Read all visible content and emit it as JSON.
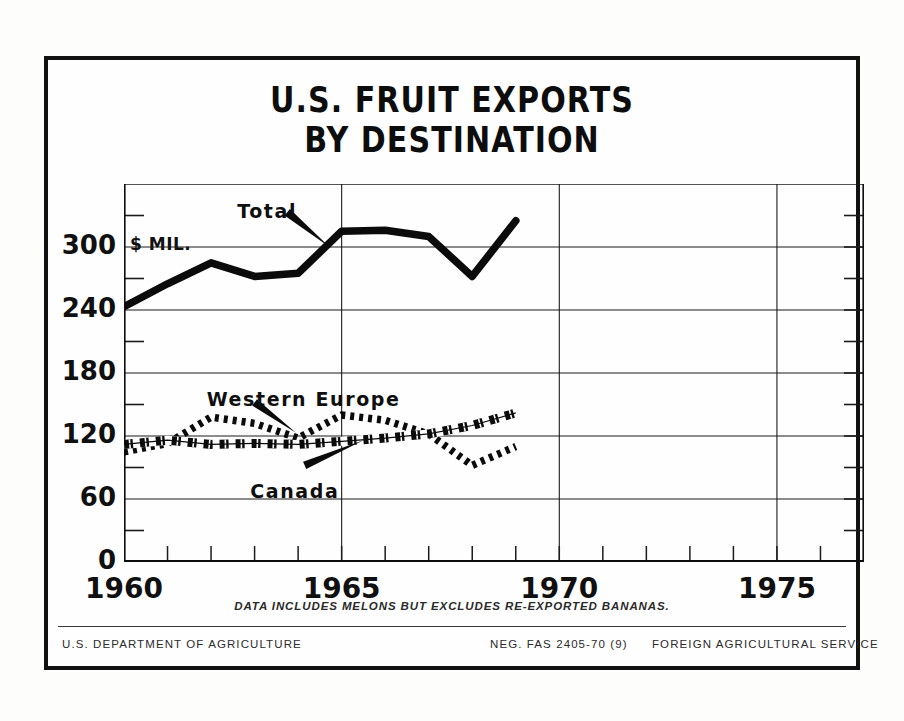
{
  "poster": {
    "title_line1": "U.S. FRUIT EXPORTS",
    "title_line2": "BY DESTINATION",
    "y_axis_caption": "$ MIL.",
    "footnote": "DATA INCLUDES MELONS BUT EXCLUDES RE-EXPORTED BANANAS.",
    "footer_left": "U.S. DEPARTMENT OF AGRICULTURE",
    "footer_neg": "NEG. FAS 2405-70 (9)",
    "footer_right": "FOREIGN AGRICULTURAL SERVICE",
    "ink_color": "#111111",
    "paper_color": "#fdfdfb"
  },
  "chart_data": {
    "type": "line",
    "title": "U.S. FRUIT EXPORTS BY DESTINATION",
    "xlabel": "",
    "ylabel": "$ MIL.",
    "xlim": [
      1960,
      1977
    ],
    "ylim": [
      0,
      360
    ],
    "grid": true,
    "legend_position": "inline-annotations",
    "y_major_ticks": [
      0,
      60,
      120,
      180,
      240,
      300
    ],
    "y_major_tick_labels": [
      "0",
      "60",
      "120",
      "180",
      "240",
      "300"
    ],
    "y_minor_ticks": [
      30,
      90,
      150,
      210,
      270,
      330
    ],
    "x_major_ticks": [
      1960,
      1965,
      1970,
      1975
    ],
    "x_major_tick_labels": [
      "1960",
      "1965",
      "1970",
      "1975"
    ],
    "x_minor_ticks": [
      1961,
      1962,
      1963,
      1964,
      1966,
      1967,
      1968,
      1969,
      1971,
      1972,
      1973,
      1974,
      1976,
      1977
    ],
    "x": [
      1960,
      1961,
      1962,
      1963,
      1964,
      1965,
      1966,
      1967,
      1968,
      1969
    ],
    "series": [
      {
        "name": "Total",
        "style": "solid-heavy",
        "values": [
          243,
          265,
          285,
          272,
          275,
          315,
          316,
          310,
          272,
          325
        ],
        "label_x": 1962.6,
        "label_y": 345
      },
      {
        "name": "Western Europe",
        "style": "dotted",
        "values": [
          105,
          113,
          138,
          132,
          118,
          140,
          135,
          122,
          92,
          110
        ],
        "label_x": 1961.9,
        "label_y": 166
      },
      {
        "name": "Canada",
        "style": "hatched",
        "values": [
          112,
          116,
          112,
          113,
          112,
          115,
          118,
          122,
          130,
          142
        ],
        "label_x": 1962.9,
        "label_y": 78
      }
    ],
    "annotations": [
      {
        "text": "Total",
        "points_to_year": 1964.5
      },
      {
        "text": "Western Europe",
        "points_to_year": 1964.0
      },
      {
        "text": "Canada",
        "points_to_year": 1965.6
      }
    ]
  }
}
